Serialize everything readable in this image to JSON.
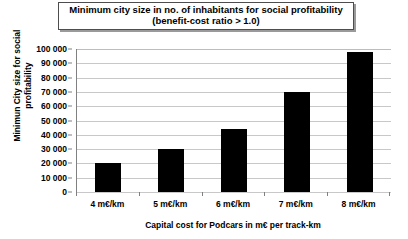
{
  "chart_data": {
    "type": "bar",
    "title": "Minimum city size in no. of inhabitants for social profitability (benefit-cost ratio > 1.0)",
    "title_lines": [
      "Minimum city size in no. of inhabitants for social profitability",
      "(benefit-cost ratio > 1.0)"
    ],
    "categories": [
      "4 m€/km",
      "5 m€/km",
      "6 m€/km",
      "7 m€/km",
      "8 m€/km"
    ],
    "values": [
      20000,
      30000,
      44000,
      70000,
      98000
    ],
    "xlabel": "Capital cost for Podcars in m€ per track-km",
    "ylabel": "Minimun City size for social profitability",
    "ylabel_lines": [
      "Minimun City size for social",
      "profitability"
    ],
    "ylim": [
      0,
      100000
    ],
    "ytick_step": 10000,
    "ytick_labels": [
      "100 000",
      "90 000",
      "80 000",
      "70 000",
      "60 000",
      "50 000",
      "40 000",
      "30 000",
      "20 000",
      "10 000",
      "0"
    ],
    "ytick_values": [
      100000,
      90000,
      80000,
      70000,
      60000,
      50000,
      40000,
      30000,
      20000,
      10000,
      0
    ],
    "grid": true,
    "legend": false,
    "bar_color": "#000000",
    "grid_color": "#c8c8c8",
    "axis_color": "#808080",
    "background_color": "#ffffff"
  }
}
